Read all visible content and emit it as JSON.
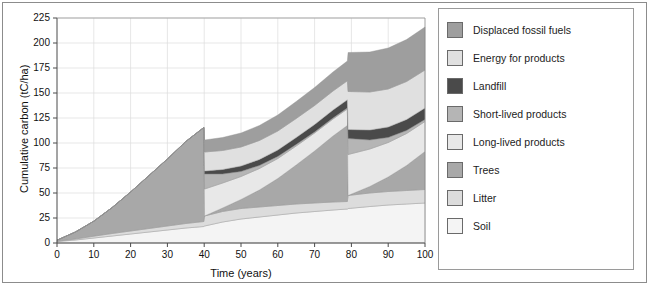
{
  "figure": {
    "background": "#ffffff",
    "border_color": "#8c8c8c"
  },
  "legend": {
    "position": "right",
    "border_color": "#9a9a9a",
    "items": [
      {
        "label": "Displaced fossil fuels",
        "color": "#9e9e9e"
      },
      {
        "label": "Energy for products",
        "color": "#e0e0e0"
      },
      {
        "label": "Landfill",
        "color": "#4a4a4a"
      },
      {
        "label": "Short-lived products",
        "color": "#b5b5b5"
      },
      {
        "label": "Long-lived products",
        "color": "#e8e8e8"
      },
      {
        "label": "Trees",
        "color": "#a8a8a8"
      },
      {
        "label": "Litter",
        "color": "#dcdcdc"
      },
      {
        "label": "Soil",
        "color": "#f4f4f4"
      }
    ]
  },
  "chart_data": {
    "type": "area",
    "title": "",
    "xlabel": "Time (years)",
    "ylabel": "Cumulative carbon (tC/ha)",
    "xlim": [
      0,
      100
    ],
    "ylim": [
      0,
      225
    ],
    "xticks": [
      0,
      10,
      20,
      30,
      40,
      50,
      60,
      70,
      80,
      90,
      100
    ],
    "yticks": [
      0,
      25,
      50,
      75,
      100,
      125,
      150,
      175,
      200,
      225
    ],
    "grid": true,
    "grid_color": "#dddddd",
    "stacked": true,
    "stack_order_bottom_to_top": [
      "Soil",
      "Litter",
      "Trees",
      "Long-lived products",
      "Short-lived products",
      "Landfill",
      "Energy for products",
      "Displaced fossil fuels"
    ],
    "x": [
      0,
      5,
      10,
      15,
      20,
      25,
      30,
      35,
      39.9,
      40.1,
      45,
      50,
      55,
      60,
      65,
      70,
      75,
      78.9,
      79.1,
      85,
      90,
      95,
      100
    ],
    "series": [
      {
        "name": "Soil",
        "color": "#f4f4f4",
        "values": [
          1.5,
          3,
          5,
          7,
          9,
          11,
          13,
          15,
          16.5,
          17,
          21,
          24,
          26,
          28,
          30,
          31.5,
          33,
          34,
          34.5,
          36.5,
          38,
          39,
          40
        ]
      },
      {
        "name": "Litter",
        "color": "#dcdcdc",
        "values": [
          0.3,
          1,
          1.8,
          2.5,
          3,
          3.5,
          4,
          4.5,
          5,
          10,
          10.5,
          10.5,
          10,
          9.5,
          9,
          8.5,
          8,
          7.5,
          13,
          13.5,
          13.5,
          13.5,
          13.5
        ]
      },
      {
        "name": "Trees",
        "color": "#a8a8a8",
        "values": [
          1,
          7,
          15,
          26,
          39,
          53,
          67,
          82,
          94,
          0,
          3.5,
          9,
          17,
          27,
          39,
          52,
          66,
          76,
          0,
          6.5,
          14.5,
          25,
          38
        ]
      },
      {
        "name": "Long-lived products",
        "color": "#e8e8e8",
        "values": [
          0,
          0,
          0,
          0,
          0,
          0,
          0,
          0,
          0,
          27,
          25,
          23,
          21.5,
          20,
          19,
          18,
          17,
          16.5,
          41,
          37.5,
          34.5,
          32,
          30
        ]
      },
      {
        "name": "Short-lived products",
        "color": "#b5b5b5",
        "values": [
          0,
          0,
          0,
          0,
          0,
          0,
          0,
          0,
          0,
          15,
          9,
          5,
          3,
          2,
          1.5,
          1,
          1,
          1,
          16,
          9,
          5,
          3,
          2
        ]
      },
      {
        "name": "Landfill",
        "color": "#4a4a4a",
        "values": [
          0,
          0,
          0,
          0,
          0,
          0,
          0,
          0,
          0,
          3,
          4.5,
          5.5,
          6,
          6.5,
          7,
          7.5,
          8,
          8.2,
          9,
          10,
          10.5,
          11,
          11.5
        ]
      },
      {
        "name": "Energy for products",
        "color": "#e0e0e0",
        "values": [
          0,
          0,
          0,
          0,
          0,
          0,
          0,
          0,
          0,
          19,
          19,
          19,
          19,
          19,
          19,
          19,
          19,
          19,
          38,
          38,
          38,
          38,
          38
        ]
      },
      {
        "name": "Displaced fossil fuels",
        "color": "#9e9e9e",
        "values": [
          0,
          0,
          0,
          0,
          0,
          0,
          0,
          0,
          0,
          12,
          13,
          14,
          15,
          16,
          17,
          18,
          19,
          19.8,
          39,
          40,
          41,
          42,
          43
        ]
      }
    ]
  }
}
